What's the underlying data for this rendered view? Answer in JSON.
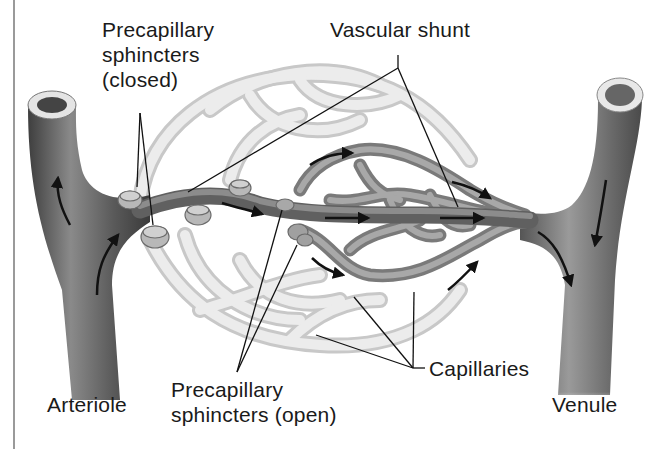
{
  "figure": {
    "palette": {
      "background": "#ffffff",
      "vessel_dark": "#5a5a5a",
      "vessel_mid": "#8a8a8a",
      "capillary_open": "#9b9b9b",
      "capillary_closed": "#e2e2e2",
      "sphincter": "#b5b5b5",
      "text": "#1a1a1a",
      "border": "#9a9a9a"
    }
  },
  "labels": {
    "sphincters_closed": {
      "line1": "Precapillary",
      "line2": "sphincters",
      "line3": "(closed)"
    },
    "vascular_shunt": "Vascular shunt",
    "capillaries": "Capillaries",
    "arteriole": "Arteriole",
    "sphincters_open": {
      "line1": "Precapillary",
      "line2": "sphincters (open)"
    },
    "venule": "Venule"
  }
}
